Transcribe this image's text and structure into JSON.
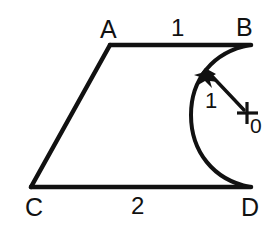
{
  "figure": {
    "background_color": "#ffffff",
    "stroke_color": "#111111",
    "vertices": {
      "A": {
        "label": "A",
        "x": 110,
        "y": 45
      },
      "B": {
        "label": "B",
        "x": 250,
        "y": 45
      },
      "C": {
        "label": "C",
        "x": 31,
        "y": 187
      },
      "D": {
        "label": "D",
        "x": 250,
        "y": 187
      }
    },
    "side_lengths": {
      "top_AB": "1",
      "bottom_CD": "2"
    },
    "arc": {
      "radius_label": "1",
      "center_label": "0",
      "center_x": 247,
      "center_y": 113,
      "radius": 57,
      "arrow_tip_x": 206,
      "arrow_tip_y": 70
    },
    "center_marker": "plus-cross-icon",
    "arrow_marker": "arrowhead-icon"
  }
}
